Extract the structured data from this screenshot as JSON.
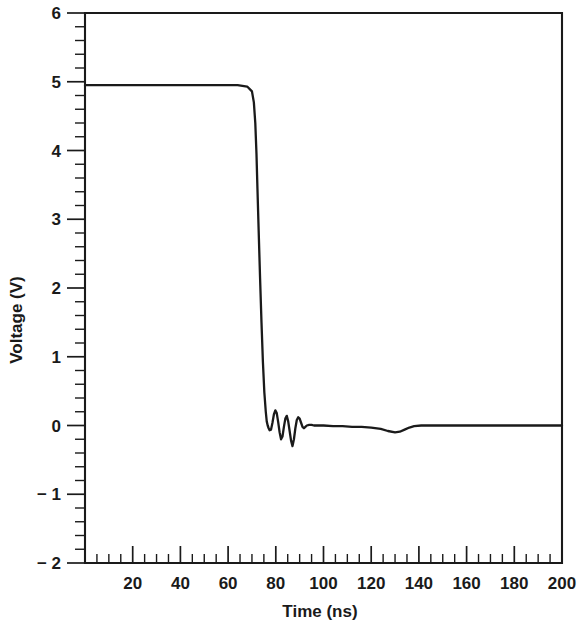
{
  "chart_data": {
    "type": "line",
    "title": "",
    "xlabel": "Time (ns)",
    "ylabel": "Voltage (V)",
    "xlim": [
      0,
      200
    ],
    "ylim": [
      -2,
      6
    ],
    "grid": false,
    "legend": null,
    "x_major_ticks": [
      0,
      20,
      40,
      60,
      80,
      100,
      120,
      140,
      160,
      180,
      200
    ],
    "x_tick_labels": [
      "",
      "20",
      "40",
      "60",
      "80",
      "100",
      "120",
      "140",
      "160",
      "180",
      "200"
    ],
    "x_minor_step": 5,
    "y_major_ticks": [
      -2,
      -1,
      0,
      1,
      2,
      3,
      4,
      5,
      6
    ],
    "y_tick_labels": [
      "− 2",
      "− 1",
      "0",
      "1",
      "2",
      "3",
      "4",
      "5",
      "6"
    ],
    "y_minor_step": 0.2,
    "series": [
      {
        "name": "Output voltage",
        "color": "#1a1a1a",
        "x": [
          0,
          4,
          10,
          18,
          26,
          34,
          42,
          50,
          58,
          64,
          68,
          70,
          70.8,
          71.4,
          71.9,
          72.3,
          72.8,
          73.4,
          74.0,
          74.6,
          75.2,
          75.8,
          76.2,
          76.6,
          77.0,
          77.4,
          78.0,
          78.6,
          79.2,
          79.8,
          80.4,
          81.0,
          81.6,
          82.2,
          82.8,
          83.4,
          84.0,
          84.6,
          85.2,
          85.8,
          86.4,
          87.0,
          87.6,
          88.2,
          88.8,
          89.4,
          90.0,
          90.6,
          91.2,
          91.8,
          92.4,
          93.0,
          94.0,
          95.0,
          96.0,
          98.0,
          100.0,
          104.0,
          108.0,
          112.0,
          116.0,
          120.0,
          124.0,
          127.0,
          130.0,
          132.0,
          134.0,
          136.0,
          138.0,
          141.0,
          145.0,
          150.0,
          158.0,
          166.0,
          175.0,
          185.0,
          195.0,
          200.0
        ],
        "y": [
          4.95,
          4.95,
          4.95,
          4.95,
          4.95,
          4.95,
          4.95,
          4.95,
          4.95,
          4.95,
          4.93,
          4.86,
          4.7,
          4.4,
          3.95,
          3.45,
          2.85,
          2.15,
          1.5,
          0.92,
          0.48,
          0.2,
          0.06,
          0.0,
          -0.04,
          -0.07,
          -0.06,
          0.04,
          0.16,
          0.22,
          0.18,
          0.05,
          -0.1,
          -0.2,
          -0.16,
          -0.02,
          0.1,
          0.14,
          0.06,
          -0.08,
          -0.22,
          -0.3,
          -0.2,
          -0.04,
          0.08,
          0.12,
          0.1,
          0.04,
          -0.02,
          -0.04,
          -0.02,
          0.0,
          0.01,
          0.01,
          0.0,
          0.0,
          0.0,
          -0.01,
          -0.01,
          -0.02,
          -0.02,
          -0.03,
          -0.05,
          -0.08,
          -0.1,
          -0.09,
          -0.06,
          -0.03,
          -0.01,
          0.0,
          0.0,
          0.0,
          0.0,
          0.0,
          0.0,
          0.0,
          0.0,
          0.0
        ]
      }
    ]
  },
  "axes": {
    "x_title": "Time (ns)",
    "y_title": "Voltage (V)"
  },
  "ticks": {
    "x": [
      "",
      "20",
      "40",
      "60",
      "80",
      "100",
      "120",
      "140",
      "160",
      "180",
      "200"
    ],
    "y": [
      "6",
      "5",
      "4",
      "3",
      "2",
      "1",
      "0",
      "− 1",
      "− 2"
    ]
  },
  "colors": {
    "trace": "#1a1a1a",
    "frame": "#1a1a1a",
    "background": "#ffffff"
  }
}
